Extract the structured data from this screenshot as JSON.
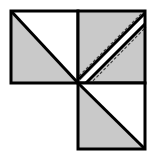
{
  "figure": {
    "width": 149,
    "height": 156,
    "background_color": "#ffffff",
    "fill_gray": "#c9c9c9",
    "fill_white": "#ffffff",
    "stroke_color": "#000000",
    "dash_color": "#3a3a3a",
    "stroke_width": 3,
    "dash_width": 1,
    "dash_pattern": "3 2",
    "geometry": {
      "grid_left": 11,
      "grid_mid_x": 78,
      "grid_right": 145,
      "grid_top": 11,
      "grid_mid_y": 83,
      "grid_bottom": 149,
      "cell_size": 67
    },
    "shapes": [
      {
        "name": "top-left-square",
        "type": "square",
        "x": 11,
        "y": 11,
        "size": 67,
        "diagonal": "top-left-to-bottom-right",
        "shaded_half": "lower-left",
        "fill": "#c9c9c9"
      },
      {
        "name": "top-right-square",
        "type": "square",
        "x": 78,
        "y": 11,
        "size": 67,
        "diagonal": "bottom-left-to-top-right",
        "band": "white-diagonal-band",
        "band_width": 9,
        "fill": "#c9c9c9"
      },
      {
        "name": "bottom-left-cell",
        "type": "empty",
        "x": 11,
        "y": 83,
        "size": 67,
        "fill": "#ffffff"
      },
      {
        "name": "bottom-right-square",
        "type": "square",
        "x": 78,
        "y": 83,
        "size": 67,
        "diagonal": "top-left-to-bottom-right",
        "shaded_half": "lower-left",
        "fill": "#c9c9c9"
      }
    ],
    "dashed_guides": [
      {
        "name": "upper-dashed-guide",
        "from_x": 78,
        "from_y": 78,
        "to_x": 145,
        "to_y": 11
      },
      {
        "name": "lower-dashed-guide",
        "from_x": 84,
        "from_y": 86,
        "to_x": 145,
        "to_y": 25
      }
    ]
  }
}
